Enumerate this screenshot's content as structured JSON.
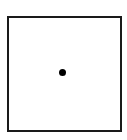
{
  "diagram": {
    "shapes": [
      {
        "type": "square",
        "stroke": "#1a1a1a",
        "fill": "#ffffff"
      },
      {
        "type": "dot",
        "position": "center",
        "fill": "#000000"
      }
    ]
  }
}
